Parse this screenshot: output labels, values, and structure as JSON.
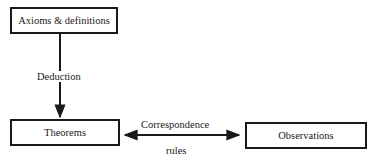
{
  "diagram": {
    "nodes": {
      "axioms": {
        "label": "Axioms & definitions"
      },
      "theorems": {
        "label": "Theorems"
      },
      "observations": {
        "label": "Observations"
      }
    },
    "edges": {
      "deduction": {
        "label": "Deduction",
        "from": "axioms",
        "to": "theorems",
        "direction": "one-way"
      },
      "correspondence": {
        "label_top": "Correspondence",
        "label_bottom": "rules",
        "from": "theorems",
        "to": "observations",
        "direction": "two-way"
      }
    },
    "colors": {
      "stroke": "#1a1a1a",
      "background": "#ffffff"
    }
  }
}
